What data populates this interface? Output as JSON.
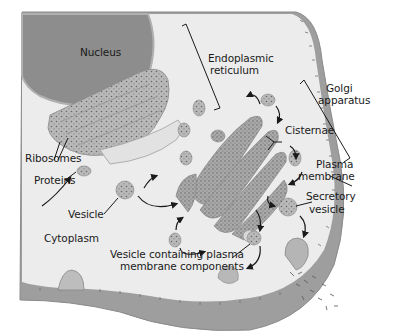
{
  "diagram": {
    "type": "cell-secretory-pathway",
    "colors": {
      "background": "#ffffff",
      "cytoplasm": "#ececec",
      "membrane": "#9a9a9a",
      "nucleus": "#8c8c8c",
      "organelle": "#b8b8b8",
      "organelle_dots": "#6a6a6a",
      "text": "#1a1a1a"
    },
    "labels": {
      "nucleus": "Nucleus",
      "er_line1": "Endoplasmic",
      "er_line2": "reticulum",
      "golgi_line1": "Golgi",
      "golgi_line2": "apparatus",
      "cisternae": "Cisternae",
      "plasma_line1": "Plasma",
      "plasma_line2": "membrane",
      "secretory_line1": "Secretory",
      "secretory_line2": "vesicle",
      "ribosomes": "Ribosomes",
      "proteins": "Proteins",
      "vesicle": "Vesicle",
      "cytoplasm": "Cytoplasm",
      "vcpm_line1": "Vesicle containing plasma",
      "vcpm_line2": "membrane components"
    }
  }
}
